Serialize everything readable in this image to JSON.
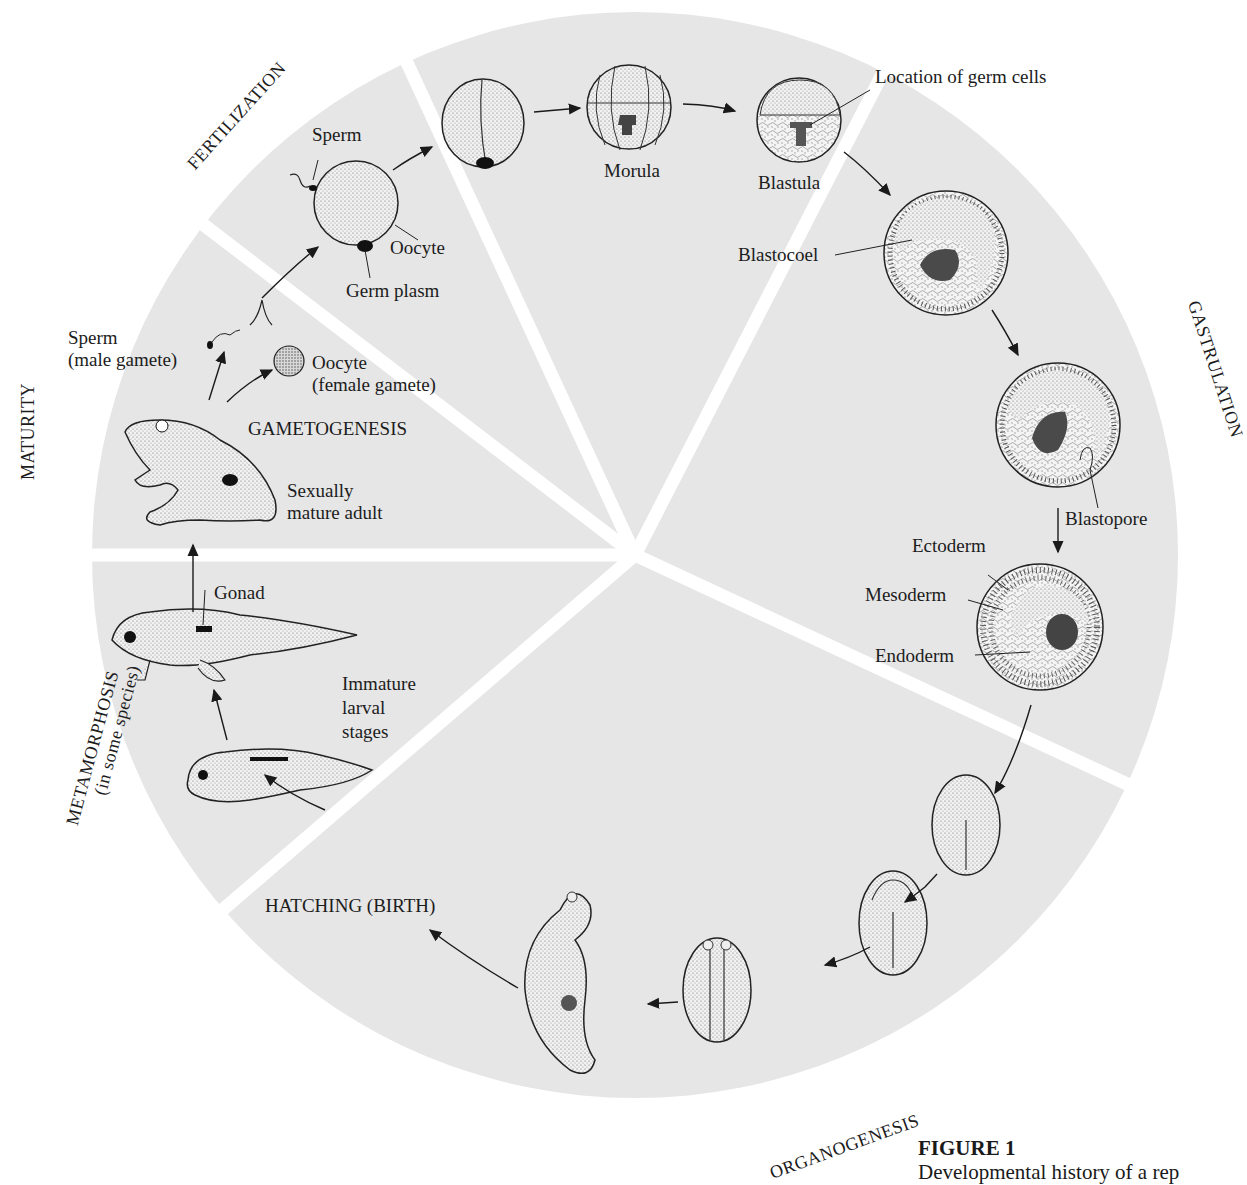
{
  "figure": {
    "title": "FIGURE 1",
    "caption": "Developmental history of a rep"
  },
  "colors": {
    "wheel_fill": "#e6e6e6",
    "divider": "#ffffff",
    "ink": "#1c1c1c",
    "germ_dark": "#555555"
  },
  "stages": {
    "fertilization": "FERTILIZATION",
    "gastrulation": "GASTRULATION",
    "organogenesis": "ORGANOGENESIS",
    "metamorphosis": "METAMORPHOSIS",
    "metamorphosis_note": "(in some species)",
    "maturity": "MATURITY",
    "gametogenesis": "GAMETOGENESIS",
    "hatching": "HATCHING (BIRTH)"
  },
  "labels": {
    "sperm": "Sperm",
    "oocyte": "Oocyte",
    "germ_plasm": "Germ plasm",
    "morula": "Morula",
    "blastula": "Blastula",
    "location_germ_cells": "Location of germ cells",
    "blastocoel": "Blastocoel",
    "blastopore": "Blastopore",
    "ectoderm": "Ectoderm",
    "mesoderm": "Mesoderm",
    "endoderm": "Endoderm",
    "gonad": "Gonad",
    "immature_larval": [
      "Immature",
      "larval",
      "stages"
    ],
    "sperm_male": [
      "Sperm",
      "(male gamete)"
    ],
    "oocyte_female": [
      "Oocyte",
      "(female gamete)"
    ],
    "adult": [
      "Sexually",
      "mature adult"
    ]
  }
}
